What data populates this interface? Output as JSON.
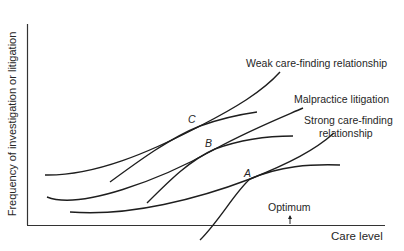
{
  "diagram": {
    "y_axis_label": "Frequency of investigation or litigation",
    "x_axis_label": "Care level",
    "curve_labels": {
      "weak": "Weak care-finding relationship",
      "malpractice": "Malpractice litigation",
      "strong_line1": "Strong care-finding",
      "strong_line2": "relationship"
    },
    "points": {
      "a": "A",
      "b": "B",
      "c": "C"
    },
    "optimum_label": "Optimum",
    "line_color": "#1e1e1e"
  }
}
